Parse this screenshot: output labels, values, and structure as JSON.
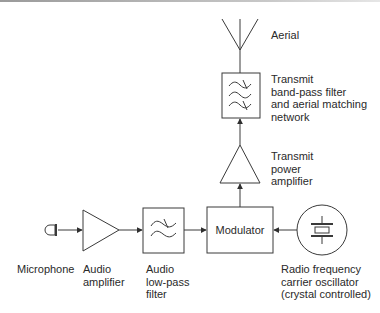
{
  "diagram": {
    "colors": {
      "stroke": "#3a3a3a",
      "text": "#2a2a2a",
      "background": "#ffffff"
    },
    "blocks": {
      "microphone": {
        "label": "Microphone",
        "icon": "microphone-icon"
      },
      "audio_amplifier": {
        "label": "Audio\namplifier",
        "icon": "amplifier-triangle-icon"
      },
      "audio_lowpass_filter": {
        "label": "Audio\nlow-pass\nfilter",
        "icon": "lowpass-filter-icon"
      },
      "modulator": {
        "label": "Modulator"
      },
      "rf_oscillator": {
        "label": "Radio frequency\ncarrier oscillator\n(crystal controlled)",
        "icon": "crystal-oscillator-icon"
      },
      "tx_power_amplifier": {
        "label": "Transmit\npower\namplifier",
        "icon": "amplifier-triangle-icon"
      },
      "tx_bandpass_filter": {
        "label": "Transmit\nband-pass filter\nand aerial matching\nnetwork",
        "icon": "bandpass-filter-icon"
      },
      "aerial": {
        "label": "Aerial",
        "icon": "antenna-icon"
      }
    },
    "connections": [
      {
        "from": "microphone",
        "to": "audio_amplifier"
      },
      {
        "from": "audio_amplifier",
        "to": "audio_lowpass_filter"
      },
      {
        "from": "audio_lowpass_filter",
        "to": "modulator"
      },
      {
        "from": "rf_oscillator",
        "to": "modulator"
      },
      {
        "from": "modulator",
        "to": "tx_power_amplifier"
      },
      {
        "from": "tx_power_amplifier",
        "to": "tx_bandpass_filter"
      },
      {
        "from": "tx_bandpass_filter",
        "to": "aerial"
      }
    ]
  }
}
